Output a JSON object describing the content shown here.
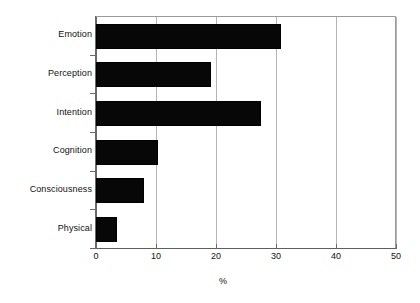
{
  "chart_data": {
    "type": "bar",
    "orientation": "horizontal",
    "title": "",
    "subtitle": "",
    "xlabel": "%",
    "ylabel": "",
    "categories": [
      "Emotion",
      "Perception",
      "Intention",
      "Cognition",
      "Consciousness",
      "Physical"
    ],
    "values": [
      30.8,
      19.2,
      27.5,
      10.4,
      8.0,
      3.5
    ],
    "series": [
      {
        "name": "",
        "values": [
          30.8,
          19.2,
          27.5,
          10.4,
          8.0,
          3.5
        ]
      }
    ],
    "xlim": [
      0,
      50
    ],
    "xticks": [
      0,
      10,
      20,
      30,
      40,
      50
    ],
    "xtick_labels": [
      "0",
      "10",
      "20",
      "30",
      "40",
      "50"
    ],
    "grid": true,
    "grid_axis": "x",
    "legend": false,
    "legend_position": "none",
    "bar_color": "#000000",
    "grid_color": "#b5b5b5",
    "axis_color": "#6a6a6a",
    "background_color": "#ffffff",
    "text_color": "#111111"
  },
  "axis": {
    "x_title": "%",
    "ticks": [
      {
        "label": "0",
        "value": 0
      },
      {
        "label": "10",
        "value": 10
      },
      {
        "label": "20",
        "value": 20
      },
      {
        "label": "30",
        "value": 30
      },
      {
        "label": "40",
        "value": 40
      },
      {
        "label": "50",
        "value": 50
      }
    ]
  },
  "bars": [
    {
      "label": "Emotion",
      "value": 30.8
    },
    {
      "label": "Perception",
      "value": 19.2
    },
    {
      "label": "Intention",
      "value": 27.5
    },
    {
      "label": "Cognition",
      "value": 10.4
    },
    {
      "label": "Consciousness",
      "value": 8.0
    },
    {
      "label": "Physical",
      "value": 3.5
    }
  ]
}
